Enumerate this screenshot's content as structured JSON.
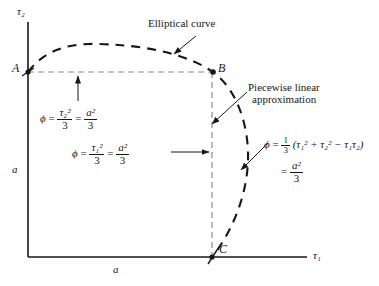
{
  "figure": {
    "axes": {
      "x_axis_label": "τ₁",
      "y_axis_label": "τ₂",
      "x_tick_label": "a",
      "y_tick_label": "a"
    },
    "points": [
      {
        "name": "A",
        "label": "A",
        "x": 28,
        "y": 72
      },
      {
        "name": "B",
        "label": "B",
        "x": 213,
        "y": 72
      },
      {
        "name": "C",
        "label": "C",
        "x": 212,
        "y": 257
      }
    ],
    "annotations": {
      "elliptical_curve": "Elliptical curve",
      "piecewise_line1": "Piecewise linear",
      "piecewise_line2": "approximation"
    },
    "equations": {
      "left": {
        "phi": "ϕ",
        "eq1": "=",
        "frac1_num": "τ₂²",
        "frac1_den": "3",
        "eq2": "=",
        "frac2_num": "a²",
        "frac2_den": "3"
      },
      "middle": {
        "phi": "ϕ",
        "eq1": "=",
        "frac1_num": "τ₁²",
        "frac1_den": "3",
        "eq2": "=",
        "frac2_num": "a²",
        "frac2_den": "3"
      },
      "right": {
        "phi": "ϕ",
        "eq1": "=",
        "coef_num": "1",
        "coef_den": "3",
        "body": "(τ₁² + τ₂² − τ₁τ₂)",
        "eq2": "=",
        "frac2_num": "a²",
        "frac2_den": "3"
      }
    },
    "colors": {
      "ink": "#17171a",
      "background": "#ffffff"
    }
  }
}
